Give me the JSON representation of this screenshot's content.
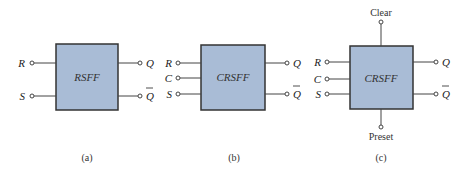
{
  "colors": {
    "box_fill": "#a9bcd6",
    "box_stroke": "#333333",
    "line": "#444444"
  },
  "diagrams": [
    {
      "caption": "(a)",
      "name": "RSFF",
      "inputs": [
        "R",
        "S"
      ],
      "outputs": [
        "Q",
        "Q"
      ]
    },
    {
      "caption": "(b)",
      "name": "CRSFF",
      "inputs": [
        "R",
        "C",
        "S"
      ],
      "outputs": [
        "Q",
        "Q"
      ]
    },
    {
      "caption": "(c)",
      "name": "CRSFF",
      "inputs": [
        "R",
        "C",
        "S"
      ],
      "outputs": [
        "Q",
        "Q"
      ],
      "top_input": "Clear",
      "bottom_input": "Preset"
    }
  ]
}
